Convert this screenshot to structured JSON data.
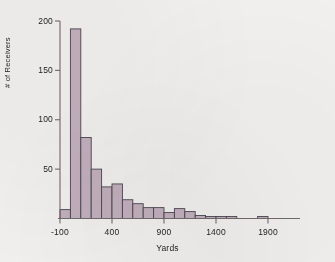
{
  "chart_data": {
    "type": "bar",
    "title": "",
    "xlabel": "Yards",
    "ylabel": "# of Receivers",
    "xlim": [
      -150,
      2000
    ],
    "ylim": [
      0,
      205
    ],
    "grid": false,
    "legend": null,
    "bin_width": 100,
    "xticks": [
      -100,
      400,
      900,
      1400,
      1900
    ],
    "xtick_labels": [
      "-100",
      "400",
      "900",
      "1400",
      "1900"
    ],
    "yticks": [
      50,
      100,
      150,
      200
    ],
    "ytick_labels": [
      "50",
      "100",
      "150",
      "200"
    ],
    "bin_starts": [
      -100,
      0,
      100,
      200,
      300,
      400,
      500,
      600,
      700,
      800,
      900,
      1000,
      1100,
      1200,
      1300,
      1400,
      1500,
      1600,
      1800
    ],
    "categories": [
      "-100",
      "0",
      "100",
      "200",
      "300",
      "400",
      "500",
      "600",
      "700",
      "800",
      "900",
      "1000",
      "1100",
      "1200",
      "1300",
      "1400",
      "1500",
      "1600",
      "1800"
    ],
    "values": [
      9,
      192,
      82,
      50,
      32,
      35,
      19,
      15,
      11,
      11,
      6,
      10,
      7,
      3,
      2,
      2,
      2,
      0,
      2
    ],
    "colors": {
      "bar_fill": "#c2b0bd",
      "bar_edge": "#4a4450",
      "axis": "#6f6b6c",
      "text": "#1e1c1d",
      "background": "#f2f0ee"
    }
  },
  "axes": {
    "x_title": "Yards",
    "y_title": "# of Receivers"
  }
}
